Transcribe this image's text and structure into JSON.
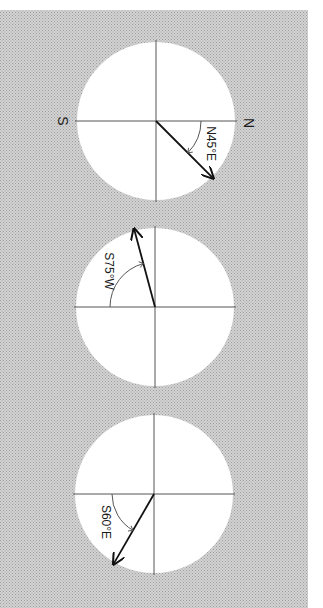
{
  "figure": {
    "orientation": "rotated-90-clockwise",
    "colors": {
      "background_halftone": "#c8c8c8",
      "background_dot": "#9e9e9e",
      "circle_fill": "#ffffff",
      "axis_line": "#555555",
      "arrow": "#111111",
      "text": "#1a1a1a"
    },
    "cardinal_labels": {
      "north": "N",
      "south": "S"
    },
    "bearings": [
      {
        "label": "N45°E",
        "reference": "N",
        "angle_deg": 45,
        "turn_toward": "E",
        "show_cardinals": true
      },
      {
        "label": "S75°W",
        "reference": "S",
        "angle_deg": 75,
        "turn_toward": "W",
        "show_cardinals": false
      },
      {
        "label": "S60°E",
        "reference": "S",
        "angle_deg": 60,
        "turn_toward": "E",
        "show_cardinals": false
      }
    ]
  }
}
